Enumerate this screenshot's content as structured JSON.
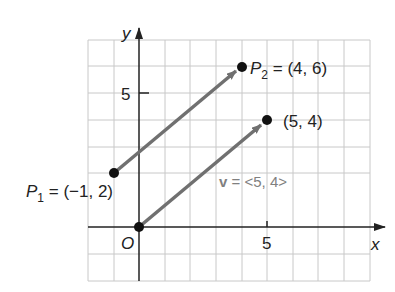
{
  "diagram": {
    "type": "coordinate-plane-vectors",
    "grid": {
      "x_min": -2,
      "x_max": 9,
      "y_min": -2,
      "y_max": 7,
      "spacing_px": 25.6
    },
    "axes": {
      "x_label": "x",
      "y_label": "y",
      "origin_label": "O",
      "x_tick_label": "5",
      "y_tick_label": "5"
    },
    "points": {
      "p1": {
        "name": "P",
        "sub": "1",
        "eq": " = (−1, 2)",
        "x": -1,
        "y": 2
      },
      "p2": {
        "name": "P",
        "sub": "2",
        "eq": " = (4, 6)",
        "x": 4,
        "y": 6
      },
      "origin": {
        "x": 0,
        "y": 0
      },
      "tip": {
        "label": "(5, 4)",
        "x": 5,
        "y": 4
      }
    },
    "vector_label": {
      "name": "v",
      "rest": " = <5, 4>"
    },
    "colors": {
      "grid": "#c8c8c8",
      "axis": "#222222",
      "arrow": "#707070",
      "point": "#111111",
      "vector_text": "#808080"
    }
  }
}
